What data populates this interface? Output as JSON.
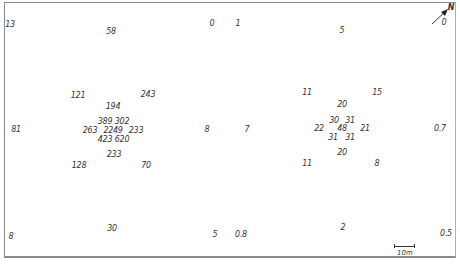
{
  "map": {
    "north_label": "N",
    "north_value": "0",
    "scale_label": "10m",
    "values": [
      {
        "text": "13",
        "x": 10,
        "y": 25
      },
      {
        "text": "58",
        "x": 111,
        "y": 32
      },
      {
        "text": "0",
        "x": 212,
        "y": 24
      },
      {
        "text": "1",
        "x": 238,
        "y": 24
      },
      {
        "text": "5",
        "x": 342,
        "y": 31
      },
      {
        "text": "121",
        "x": 78,
        "y": 96
      },
      {
        "text": "243",
        "x": 148,
        "y": 95
      },
      {
        "text": "194",
        "x": 113,
        "y": 107
      },
      {
        "text": "389",
        "x": 105,
        "y": 122
      },
      {
        "text": "302",
        "x": 122,
        "y": 122
      },
      {
        "text": "263",
        "x": 90,
        "y": 131
      },
      {
        "text": "2249",
        "x": 113,
        "y": 131
      },
      {
        "text": "233",
        "x": 136,
        "y": 131
      },
      {
        "text": "423",
        "x": 105,
        "y": 140
      },
      {
        "text": "620",
        "x": 122,
        "y": 140
      },
      {
        "text": "233",
        "x": 114,
        "y": 155
      },
      {
        "text": "128",
        "x": 79,
        "y": 166
      },
      {
        "text": "70",
        "x": 146,
        "y": 166
      },
      {
        "text": "81",
        "x": 16,
        "y": 130
      },
      {
        "text": "8",
        "x": 207,
        "y": 130
      },
      {
        "text": "7",
        "x": 247,
        "y": 130
      },
      {
        "text": "11",
        "x": 307,
        "y": 93
      },
      {
        "text": "15",
        "x": 377,
        "y": 93
      },
      {
        "text": "20",
        "x": 342,
        "y": 105
      },
      {
        "text": "30",
        "x": 334,
        "y": 121
      },
      {
        "text": "31",
        "x": 350,
        "y": 121
      },
      {
        "text": "22",
        "x": 319,
        "y": 129
      },
      {
        "text": "48",
        "x": 342,
        "y": 129
      },
      {
        "text": "21",
        "x": 365,
        "y": 129
      },
      {
        "text": "31",
        "x": 333,
        "y": 138
      },
      {
        "text": "31",
        "x": 350,
        "y": 138
      },
      {
        "text": "20",
        "x": 342,
        "y": 153
      },
      {
        "text": "11",
        "x": 307,
        "y": 164
      },
      {
        "text": "8",
        "x": 377,
        "y": 164
      },
      {
        "text": "0.7",
        "x": 440,
        "y": 129
      },
      {
        "text": "8",
        "x": 11,
        "y": 237
      },
      {
        "text": "30",
        "x": 112,
        "y": 229
      },
      {
        "text": "5",
        "x": 215,
        "y": 235
      },
      {
        "text": "0.8",
        "x": 241,
        "y": 235
      },
      {
        "text": "2",
        "x": 343,
        "y": 228
      },
      {
        "text": "0.5",
        "x": 446,
        "y": 234
      }
    ]
  }
}
